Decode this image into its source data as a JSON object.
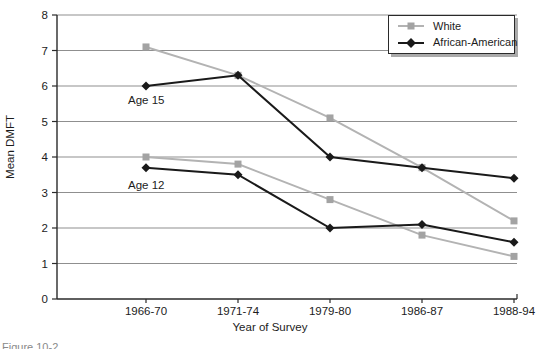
{
  "figure": {
    "caption_partial": "Figure 10-2"
  },
  "chart_data": {
    "type": "line",
    "title": "",
    "xlabel": "Year of Survey",
    "ylabel": "Mean DMFT",
    "ylim": [
      0,
      8
    ],
    "yticks": [
      0,
      1,
      2,
      3,
      4,
      5,
      6,
      7,
      8
    ],
    "grid": "horizontal",
    "legend_position": "top-right",
    "categories": [
      "1966-70",
      "1971-74",
      "1979-80",
      "1986-87",
      "1988-94"
    ],
    "series": [
      {
        "name": "White",
        "age_group": "Age 15",
        "marker": "square",
        "color": "#a3a3a3",
        "line_color": "#b3b3b3",
        "values": [
          7.1,
          6.3,
          5.1,
          3.7,
          2.2
        ]
      },
      {
        "name": "African-American",
        "age_group": "Age 15",
        "marker": "diamond",
        "color": "#1a1a1a",
        "line_color": "#1a1a1a",
        "values": [
          6.0,
          6.3,
          4.0,
          3.7,
          3.4
        ]
      },
      {
        "name": "White",
        "age_group": "Age 12",
        "marker": "square",
        "color": "#a3a3a3",
        "line_color": "#b3b3b3",
        "values": [
          4.0,
          3.8,
          2.8,
          1.8,
          1.2
        ]
      },
      {
        "name": "African-American",
        "age_group": "Age 12",
        "marker": "diamond",
        "color": "#1a1a1a",
        "line_color": "#1a1a1a",
        "values": [
          3.7,
          3.5,
          2.0,
          2.1,
          1.6
        ]
      }
    ],
    "annotations": [
      {
        "text": "Age 15",
        "x": 128,
        "y": 104
      },
      {
        "text": "Age 12",
        "x": 128,
        "y": 189
      }
    ],
    "legend": {
      "items": [
        {
          "label": "White",
          "marker": "square",
          "color": "#a3a3a3",
          "line_color": "#b3b3b3"
        },
        {
          "label": "African-American",
          "marker": "diamond",
          "color": "#1a1a1a",
          "line_color": "#1a1a1a"
        }
      ]
    },
    "colors": {
      "gridline": "#8f8f8f",
      "axis": "#2a2a2a",
      "text": "#1c1c1c"
    }
  }
}
